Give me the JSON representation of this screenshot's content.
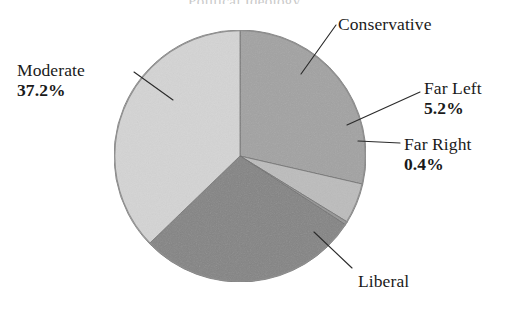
{
  "figure": {
    "background_color": "#ffffff",
    "title_cropped_text": "Political Ideology",
    "width": 513,
    "height": 312
  },
  "chart_data": {
    "type": "pie",
    "title": "",
    "xlabel": "",
    "ylabel": "",
    "legend_position": "callout-labels",
    "grid": false,
    "units": "percent",
    "categories": [
      "Conservative",
      "Far Left",
      "Far Right",
      "Liberal",
      "Moderate"
    ],
    "values": [
      28.6,
      5.2,
      0.4,
      28.6,
      37.2
    ],
    "labels_shown": {
      "Conservative": "",
      "Far Left": "5.2%",
      "Far Right": "0.4%",
      "Liberal": "",
      "Moderate": "37.2%"
    },
    "start_angle_deg": 0,
    "direction": "clockwise",
    "slices": [
      {
        "name": "Conservative",
        "value": 28.6,
        "pct_text": "",
        "color": "#a2a2a2",
        "start_deg": 0.0,
        "end_deg": 102.9
      },
      {
        "name": "Far Left",
        "value": 5.2,
        "pct_text": "5.2%",
        "color": "#bcbcbc",
        "start_deg": 102.9,
        "end_deg": 121.6
      },
      {
        "name": "Far Right",
        "value": 0.4,
        "pct_text": "0.4%",
        "color": "#969696",
        "start_deg": 121.6,
        "end_deg": 123.1
      },
      {
        "name": "Liberal",
        "value": 28.6,
        "pct_text": "",
        "color": "#848484",
        "start_deg": 123.1,
        "end_deg": 226.0
      },
      {
        "name": "Moderate",
        "value": 37.2,
        "pct_text": "37.2%",
        "color": "#d4d4d4",
        "start_deg": 226.0,
        "end_deg": 360.0
      }
    ]
  },
  "pie_geometry": {
    "center_x": 240,
    "center_y": 156,
    "radius": 126,
    "outline_color": "#8a8a8a"
  },
  "labels": {
    "moderate": {
      "name": "Moderate",
      "pct": "37.2%"
    },
    "conservative": {
      "name": "Conservative",
      "pct": ""
    },
    "far_left": {
      "name": "Far Left",
      "pct": "5.2%"
    },
    "far_right": {
      "name": "Far Right",
      "pct": "0.4%"
    },
    "liberal": {
      "name": "Liberal",
      "pct": ""
    }
  },
  "leader_lines": [
    {
      "name": "moderate-leader",
      "x1": 134,
      "y1": 72,
      "x2": 173,
      "y2": 100
    },
    {
      "name": "conservative-leader",
      "x1": 336,
      "y1": 25,
      "x2": 301,
      "y2": 74
    },
    {
      "name": "far-left-leader",
      "x1": 420,
      "y1": 92,
      "x2": 347,
      "y2": 125
    },
    {
      "name": "far-right-leader",
      "x1": 400,
      "y1": 143,
      "x2": 358,
      "y2": 141
    },
    {
      "name": "liberal-leader",
      "x1": 352,
      "y1": 268,
      "x2": 314,
      "y2": 232
    }
  ],
  "colors": {
    "moderate": "#d4d4d4",
    "conservative": "#a2a2a2",
    "far_left": "#bcbcbc",
    "far_right": "#969696",
    "liberal": "#848484",
    "text": "#1a1a1a",
    "leader_line": "#2b2b2b"
  }
}
